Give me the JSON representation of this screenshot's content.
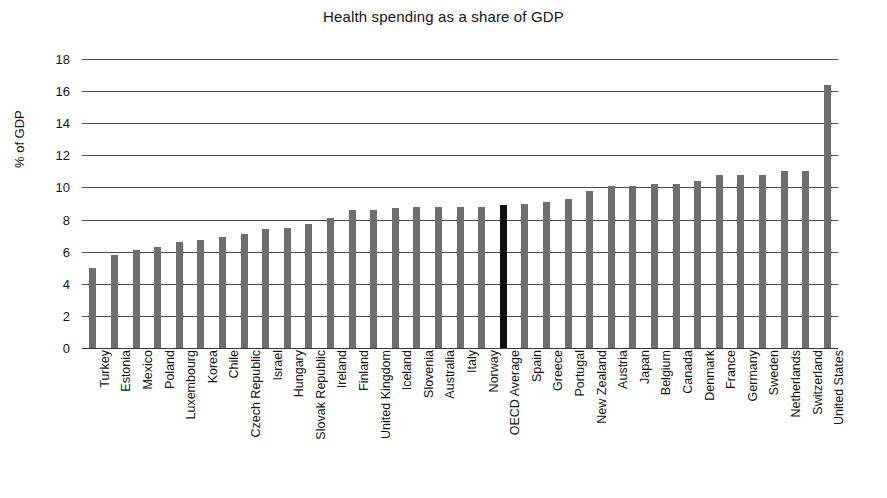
{
  "chart_data": {
    "type": "bar",
    "title": "Health spending as a share of GDP",
    "xlabel": "",
    "ylabel": "% of GDP",
    "ylim": [
      0,
      18
    ],
    "ytick_values": [
      0,
      2,
      4,
      6,
      8,
      10,
      12,
      14,
      16,
      18
    ],
    "ytick_labels": [
      "0",
      "2",
      "4",
      "6",
      "8",
      "10",
      "12",
      "14",
      "16",
      "18"
    ],
    "grid": true,
    "legend": "none",
    "bar_color": "#6e6e6e",
    "highlight_color": "#0d0d0d",
    "highlight_category": "OECD Average",
    "categories": [
      "Turkey",
      "Estonia",
      "Mexico",
      "Poland",
      "Luxembourg",
      "Korea",
      "Chile",
      "Czech Republic",
      "Israel",
      "Hungary",
      "Slovak Republic",
      "Ireland",
      "Finland",
      "United Kingdom",
      "Iceland",
      "Slovenia",
      "Australia",
      "Italy",
      "Norway",
      "OECD Average",
      "Spain",
      "Greece",
      "Portugal",
      "New Zealand",
      "Austria",
      "Japan",
      "Belgium",
      "Canada",
      "Denmark",
      "France",
      "Germany",
      "Sweden",
      "Netherlands",
      "Switzerland",
      "United States"
    ],
    "values": [
      5.0,
      5.8,
      6.1,
      6.3,
      6.6,
      6.7,
      6.9,
      7.1,
      7.4,
      7.5,
      7.7,
      8.1,
      8.6,
      8.6,
      8.7,
      8.8,
      8.8,
      8.8,
      8.8,
      8.9,
      9.0,
      9.1,
      9.3,
      9.8,
      10.1,
      10.1,
      10.2,
      10.2,
      10.4,
      10.8,
      10.8,
      10.8,
      11.0,
      11.0,
      16.4
    ]
  }
}
